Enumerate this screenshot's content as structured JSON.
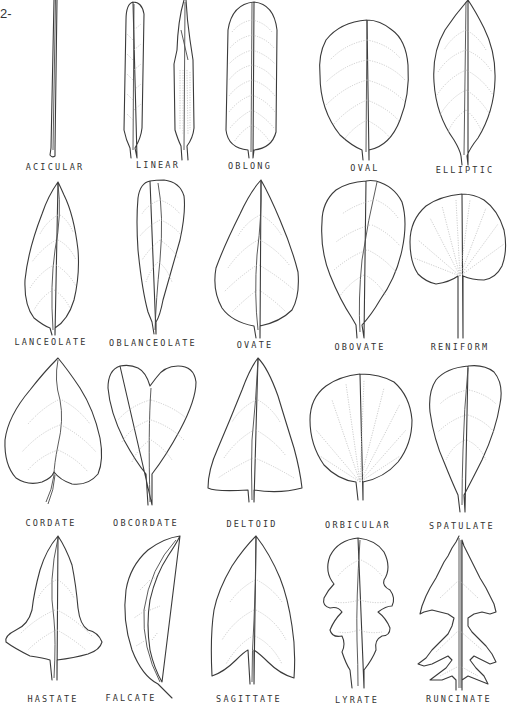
{
  "plate": {
    "page_fragment": "2-",
    "title": "Leaf shapes",
    "rows": [
      [
        {
          "label": "ACICULAR",
          "x": 55,
          "y": 168
        },
        {
          "label": "LINEAR",
          "x": 158,
          "y": 166
        },
        {
          "label": "OBLONG",
          "x": 250,
          "y": 168
        },
        {
          "label": "OVAL",
          "x": 365,
          "y": 170
        },
        {
          "label": "ELLIPTIC",
          "x": 465,
          "y": 172
        }
      ],
      [
        {
          "label": "LANCEOLATE",
          "x": 51,
          "y": 342
        },
        {
          "label": "OBLANCEOLATE",
          "x": 153,
          "y": 343
        },
        {
          "label": "OVATE",
          "x": 255,
          "y": 345
        },
        {
          "label": "OBOVATE",
          "x": 360,
          "y": 347
        },
        {
          "label": "RENIFORM",
          "x": 460,
          "y": 347
        }
      ],
      [
        {
          "label": "CORDATE",
          "x": 51,
          "y": 524
        },
        {
          "label": "OBCORDATE",
          "x": 146,
          "y": 524
        },
        {
          "label": "DELTOID",
          "x": 252,
          "y": 525
        },
        {
          "label": "ORBICULAR",
          "x": 358,
          "y": 526
        },
        {
          "label": "SPATULATE",
          "x": 462,
          "y": 527
        }
      ],
      [
        {
          "label": "HASTATE",
          "x": 53,
          "y": 700
        },
        {
          "label": "FALCATE",
          "x": 131,
          "y": 699
        },
        {
          "label": "SAGITTATE",
          "x": 249,
          "y": 700
        },
        {
          "label": "LYRATE",
          "x": 357,
          "y": 701
        },
        {
          "label": "RUNCINATE",
          "x": 459,
          "y": 700
        }
      ]
    ]
  }
}
